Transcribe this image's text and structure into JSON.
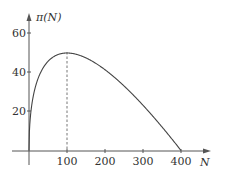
{
  "chart_data": {
    "type": "line",
    "title": "",
    "xlabel": "N",
    "ylabel": "π(N)",
    "xlim": [
      0,
      400
    ],
    "ylim": [
      0,
      60
    ],
    "x_ticks": [
      100,
      200,
      300,
      400
    ],
    "y_ticks": [
      20,
      40,
      60
    ],
    "grid": false,
    "legend": null,
    "series": [
      {
        "name": "π(N)",
        "function": "10*sqrt(N) - N/2",
        "x": [
          0,
          5,
          10,
          25,
          50,
          75,
          100,
          150,
          200,
          250,
          300,
          350,
          400
        ],
        "values": [
          0,
          19.9,
          26.6,
          37.5,
          45.7,
          49.1,
          50,
          47.5,
          41.4,
          33.1,
          23.2,
          12.1,
          0
        ]
      }
    ],
    "annotations": [
      {
        "type": "dashed-vertical-line",
        "x": 100,
        "y_from": 0,
        "y_to": 50,
        "note": "maximum at N=100, π=50"
      }
    ]
  },
  "labels": {
    "y_axis": "π(N)",
    "x_axis": "N",
    "y_ticks": [
      "20",
      "40",
      "60"
    ],
    "x_ticks": [
      "100",
      "200",
      "300",
      "400"
    ]
  }
}
